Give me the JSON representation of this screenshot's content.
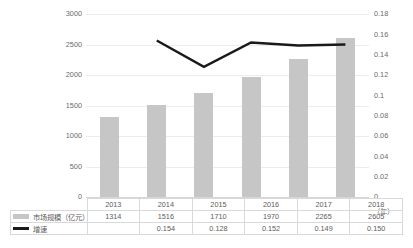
{
  "chart_data": {
    "type": "bar",
    "title": "",
    "subtitle": "",
    "xlabel": "（年）",
    "ylabel": "",
    "categories": [
      "2013",
      "2014",
      "2015",
      "2016",
      "2017",
      "2018"
    ],
    "grid": true,
    "legend_position": "table-left",
    "left_axis": {
      "name": "市场规模（亿元）",
      "ylim": [
        0,
        3000
      ],
      "ticks": [
        "0",
        "500",
        "1000",
        "1500",
        "2000",
        "2500",
        "3000"
      ],
      "tick_values": [
        0,
        500,
        1000,
        1500,
        2000,
        2500,
        3000
      ]
    },
    "right_axis": {
      "name": "增速",
      "ylim": [
        0,
        0.18
      ],
      "ticks": [
        "0",
        "0.02",
        "0.04",
        "0.06",
        "0.08",
        "0.1",
        "0.12",
        "0.14",
        "0.16",
        "0.18"
      ],
      "tick_values": [
        0,
        0.02,
        0.04,
        0.06,
        0.08,
        0.1,
        0.12,
        0.14,
        0.16,
        0.18
      ]
    },
    "series": [
      {
        "name": "市场规模（亿元）",
        "type": "bar",
        "axis": "left",
        "color": "#c6c6c6",
        "values": [
          1314,
          1516,
          1710,
          1970,
          2265,
          2605
        ],
        "labels": [
          "1314",
          "1516",
          "1710",
          "1970",
          "2265",
          "2605"
        ]
      },
      {
        "name": "增速",
        "type": "line",
        "axis": "right",
        "color": "#1a1a1a",
        "values": [
          null,
          0.154,
          0.128,
          0.152,
          0.149,
          0.15
        ],
        "labels": [
          "",
          "0.154",
          "0.128",
          "0.152",
          "0.149",
          "0.150"
        ]
      }
    ]
  },
  "legend": {
    "bar_label": "市场规模（亿元）",
    "line_label": "增速"
  },
  "table": {
    "corner": "",
    "header": [
      "2013",
      "2014",
      "2015",
      "2016",
      "2017",
      "2018"
    ],
    "rows": [
      {
        "label": "市场规模（亿元）",
        "marker": "bar",
        "cells": [
          "1314",
          "1516",
          "1710",
          "1970",
          "2265",
          "2605"
        ]
      },
      {
        "label": "增速",
        "marker": "line",
        "cells": [
          "",
          "0.154",
          "0.128",
          "0.152",
          "0.149",
          "0.150"
        ]
      }
    ]
  },
  "axis_unit": "（年）"
}
